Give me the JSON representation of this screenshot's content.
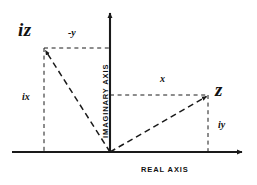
{
  "diagram": {
    "axes": {
      "real_axis_label": "REAL AXIS",
      "imaginary_axis_label": "IMAGINARY AXIS",
      "real_axis_arrow": "arrow-right-icon",
      "imaginary_axis_arrow": "arrow-up-icon",
      "origin": {
        "x": 110,
        "y": 152
      }
    },
    "points": [
      {
        "id": "iz",
        "label": "iz",
        "x": 44,
        "y": 48,
        "description": "point iz in second quadrant"
      },
      {
        "id": "z",
        "label": "z",
        "x": 208,
        "y": 95,
        "description": "point z in first quadrant"
      }
    ],
    "components": [
      {
        "id": "neg-y",
        "label": "-y",
        "x": 70,
        "y": 30,
        "axis": "real",
        "belongs_to": "iz"
      },
      {
        "id": "ix",
        "label": "ix",
        "x": 24,
        "y": 96,
        "axis": "imaginary",
        "belongs_to": "iz"
      },
      {
        "id": "x",
        "label": "x",
        "x": 162,
        "y": 78,
        "axis": "real",
        "belongs_to": "z"
      },
      {
        "id": "iy",
        "label": "iy",
        "x": 221,
        "y": 125,
        "axis": "imaginary",
        "belongs_to": "z"
      }
    ],
    "vectors": [
      {
        "id": "vector-iz",
        "from": "origin",
        "to": "iz",
        "style": "dashed",
        "arrowhead": true
      },
      {
        "id": "vector-z",
        "from": "origin",
        "to": "z",
        "style": "dashed",
        "arrowhead": true
      }
    ],
    "guides": [
      {
        "id": "guide-iz-vertical",
        "style": "dashed",
        "orientation": "vertical"
      },
      {
        "id": "guide-iz-horizontal",
        "style": "dashed",
        "orientation": "horizontal"
      },
      {
        "id": "guide-z-vertical",
        "style": "dashed",
        "orientation": "vertical"
      },
      {
        "id": "guide-z-horizontal",
        "style": "dashed",
        "orientation": "horizontal"
      }
    ],
    "colors": {
      "background": "#ffffff",
      "stroke": "#1a1a1a",
      "text": "#111111"
    }
  }
}
